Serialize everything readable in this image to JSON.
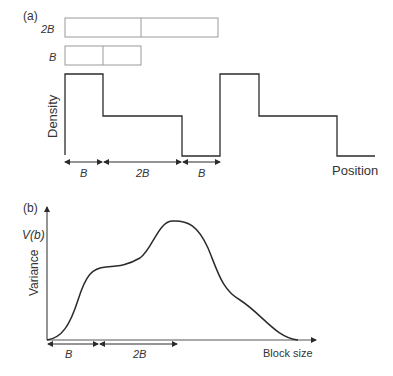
{
  "panel_a": {
    "label": "(a)",
    "blocks": [
      {
        "label": "2B",
        "segments": 2
      },
      {
        "label": "B",
        "segments": 2
      }
    ],
    "y_axis_label": "Density",
    "x_axis_label": "Position",
    "intervals": [
      "B",
      "2B",
      "B"
    ]
  },
  "panel_b": {
    "label": "(b)",
    "y_tick_label": "V(b)",
    "y_axis_label": "Variance",
    "x_axis_label": "Block size",
    "intervals": [
      "B",
      "2B"
    ]
  },
  "colors": {
    "line": "#2b2b2b",
    "box": "#9a9a9a",
    "text": "#333333"
  }
}
